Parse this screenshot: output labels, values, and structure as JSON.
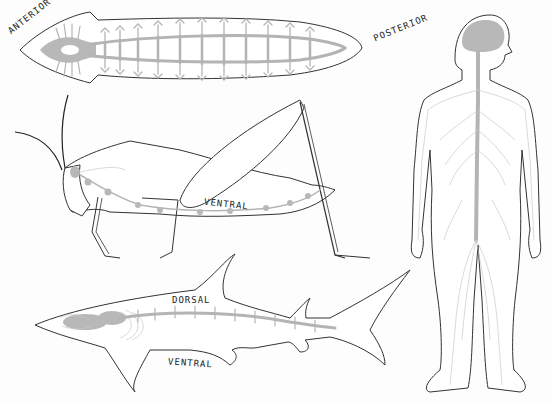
{
  "diagram": {
    "specimens": [
      {
        "id": "flatworm",
        "labels": {
          "anterior": "ANTERIOR",
          "posterior": "POSTERIOR"
        }
      },
      {
        "id": "grasshopper",
        "labels": {
          "ventral": "VENTRAL"
        }
      },
      {
        "id": "shark",
        "labels": {
          "dorsal": "DORSAL",
          "ventral": "VENTRAL"
        }
      },
      {
        "id": "human",
        "labels": {}
      }
    ]
  },
  "colors": {
    "outline": "#333333",
    "nerve": "#b4b4b4",
    "background": "#fdfdfd"
  }
}
